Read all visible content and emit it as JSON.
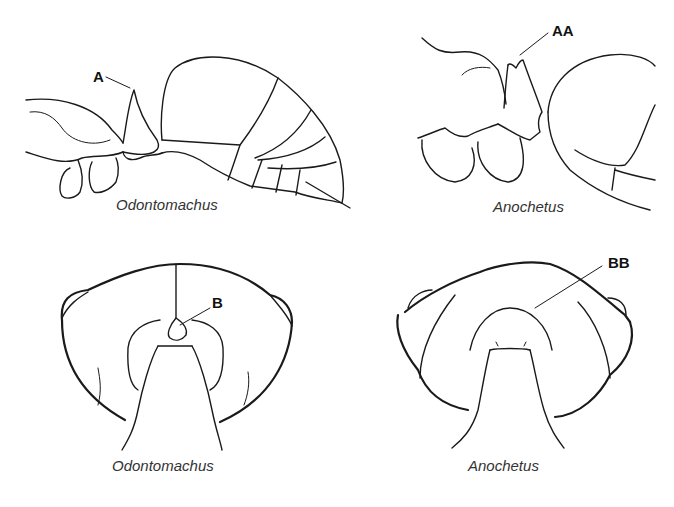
{
  "figure": {
    "panels": [
      {
        "id": "top-left",
        "caption": "Odontomachus",
        "view": "lateral",
        "label": "A"
      },
      {
        "id": "top-right",
        "caption": "Anochetus",
        "view": "lateral",
        "label": "AA"
      },
      {
        "id": "bottom-left",
        "caption": "Odontomachus",
        "view": "posterior head",
        "label": "B"
      },
      {
        "id": "bottom-right",
        "caption": "Anochetus",
        "view": "posterior head",
        "label": "BB"
      }
    ]
  }
}
